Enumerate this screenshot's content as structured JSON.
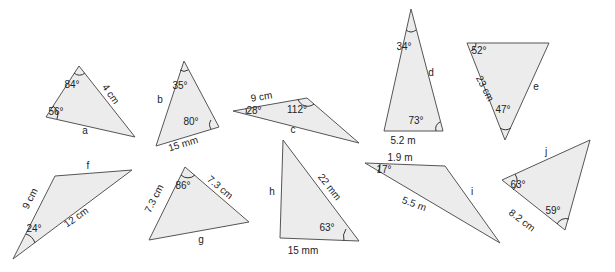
{
  "colors": {
    "fill": "#ececec",
    "stroke": "#555555",
    "text": "#222222",
    "background": "#ffffff"
  },
  "triangles": [
    {
      "id": "a",
      "points": "79,66 46,117 135,137",
      "labels": [
        {
          "text": "84°",
          "x": 72,
          "y": 88,
          "rot": 0
        },
        {
          "text": "56°",
          "x": 56,
          "y": 115,
          "rot": 0
        },
        {
          "text": "4 cm",
          "x": 108,
          "y": 96,
          "rot": 55
        },
        {
          "text": "a",
          "x": 85,
          "y": 134,
          "rot": 0
        }
      ],
      "arcs": [
        "M74,73 A8,8 0 0 0 85,73",
        "M53,106 A11,11 0 0 1 57,119"
      ]
    },
    {
      "id": "b",
      "points": "184,61 156,146 219,127",
      "labels": [
        {
          "text": "35°",
          "x": 180,
          "y": 89,
          "rot": 0
        },
        {
          "text": "80°",
          "x": 191,
          "y": 125,
          "rot": 0
        },
        {
          "text": "b",
          "x": 160,
          "y": 103,
          "rot": 0
        },
        {
          "text": "15 mm",
          "x": 184,
          "y": 147,
          "rot": -17
        }
      ],
      "arcs": [
        "M180,70 A7,7 0 0 0 188,70",
        "M211,120 A8,8 0 0 0 211,129"
      ]
    },
    {
      "id": "c",
      "points": "233,111 307,98 359,143",
      "labels": [
        {
          "text": "9 cm",
          "x": 262,
          "y": 100,
          "rot": -9
        },
        {
          "text": "112°",
          "x": 297,
          "y": 113,
          "rot": 0
        },
        {
          "text": "28°",
          "x": 254,
          "y": 114,
          "rot": 0
        },
        {
          "text": "c",
          "x": 293,
          "y": 133,
          "rot": 0
        }
      ],
      "arcs": [
        "M246,108 A12,12 0 0 1 246,114",
        "M298,99 A10,10 0 0 0 314,104"
      ]
    },
    {
      "id": "d",
      "points": "411,9 384,131 443,131",
      "labels": [
        {
          "text": "34°",
          "x": 404,
          "y": 50,
          "rot": 0
        },
        {
          "text": "d",
          "x": 431,
          "y": 76,
          "rot": 0
        },
        {
          "text": "73°",
          "x": 416,
          "y": 124,
          "rot": 0
        },
        {
          "text": "5.2 m",
          "x": 403,
          "y": 144,
          "rot": 0
        }
      ],
      "arcs": [
        "M406,30 A8,8 0 0 0 416,30",
        "M436,131 A8,8 0 0 1 440,122"
      ]
    },
    {
      "id": "e",
      "points": "467,43 549,43 505,140",
      "labels": [
        {
          "text": "52°",
          "x": 479,
          "y": 54,
          "rot": 0
        },
        {
          "text": "23 cm",
          "x": 482,
          "y": 90,
          "rot": 63
        },
        {
          "text": "e",
          "x": 536,
          "y": 90,
          "rot": 0
        },
        {
          "text": "47°",
          "x": 503,
          "y": 113,
          "rot": 0
        }
      ],
      "arcs": [
        "M476,43 A9,9 0 0 1 471,51",
        "M500,128 A10,10 0 0 0 511,128"
      ]
    },
    {
      "id": "f",
      "points": "13,259 55,176 132,170",
      "labels": [
        {
          "text": "f",
          "x": 88,
          "y": 169,
          "rot": 0
        },
        {
          "text": "9 cm",
          "x": 33,
          "y": 200,
          "rot": -63
        },
        {
          "text": "24°",
          "x": 34,
          "y": 232,
          "rot": 0
        },
        {
          "text": "12 cm",
          "x": 78,
          "y": 220,
          "rot": -35
        }
      ],
      "arcs": [
        "M26,234 A14,14 0 0 1 35,243"
      ]
    },
    {
      "id": "g",
      "points": "185,167 149,240 249,222",
      "labels": [
        {
          "text": "86°",
          "x": 183,
          "y": 189,
          "rot": 0
        },
        {
          "text": "7.3 cm",
          "x": 157,
          "y": 200,
          "rot": -63
        },
        {
          "text": "7.3 cm",
          "x": 218,
          "y": 190,
          "rot": 40
        },
        {
          "text": "g",
          "x": 201,
          "y": 243,
          "rot": 0
        }
      ],
      "arcs": [
        "M181,175 A10,10 0 0 0 195,175"
      ]
    },
    {
      "id": "h",
      "points": "283,140 280,238 359,241",
      "labels": [
        {
          "text": "h",
          "x": 272,
          "y": 195,
          "rot": 0
        },
        {
          "text": "22 mm",
          "x": 327,
          "y": 189,
          "rot": 52
        },
        {
          "text": "63°",
          "x": 327,
          "y": 231,
          "rot": 0
        },
        {
          "text": "15 mm",
          "x": 303,
          "y": 254,
          "rot": 0
        }
      ],
      "arcs": [
        "M346,229 A14,14 0 0 0 344,241"
      ]
    },
    {
      "id": "i",
      "points": "365,163 445,166 500,243",
      "labels": [
        {
          "text": "1.9 m",
          "x": 400,
          "y": 161,
          "rot": 0
        },
        {
          "text": "17°",
          "x": 384,
          "y": 173,
          "rot": 0
        },
        {
          "text": "i",
          "x": 472,
          "y": 195,
          "rot": 0
        },
        {
          "text": "5.5 m",
          "x": 413,
          "y": 207,
          "rot": 20
        }
      ],
      "arcs": [
        "M380,164 A14,14 0 0 1 378,172"
      ]
    },
    {
      "id": "j",
      "points": "502,180 590,140 565,230",
      "labels": [
        {
          "text": "j",
          "x": 546,
          "y": 155,
          "rot": 0
        },
        {
          "text": "63°",
          "x": 518,
          "y": 188,
          "rot": 0
        },
        {
          "text": "59°",
          "x": 553,
          "y": 214,
          "rot": 0
        },
        {
          "text": "8.2 cm",
          "x": 520,
          "y": 223,
          "rot": 37
        }
      ],
      "arcs": [
        "M515,174 A12,12 0 0 1 513,190",
        "M557,224 A10,10 0 0 1 569,219"
      ]
    }
  ]
}
